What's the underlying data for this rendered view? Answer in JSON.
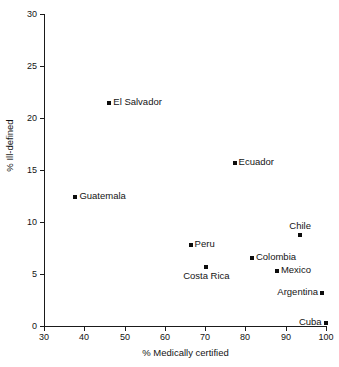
{
  "chart_data": {
    "type": "scatter",
    "title": "",
    "xlabel": "% Medically certified",
    "ylabel": "% Ill-defined",
    "xlim": [
      30,
      100
    ],
    "ylim": [
      0,
      30
    ],
    "xticks": [
      30,
      40,
      50,
      60,
      70,
      80,
      90,
      100
    ],
    "yticks": [
      0,
      5,
      10,
      15,
      20,
      25,
      30
    ],
    "xtick_labels": [
      "30",
      "40",
      "50",
      "60",
      "70",
      "80",
      "90",
      "100"
    ],
    "ytick_labels": [
      "0",
      "5",
      "10",
      "15",
      "20",
      "25",
      "30"
    ],
    "grid": false,
    "legend": "none",
    "marker": "square",
    "marker_color": "#0d0d0d",
    "points": [
      {
        "label": "El Salvador",
        "x": 46.2,
        "y": 21.4,
        "label_pos": "right"
      },
      {
        "label": "Ecuador",
        "x": 77.3,
        "y": 15.7,
        "label_pos": "right"
      },
      {
        "label": "Guatemala",
        "x": 37.8,
        "y": 12.4,
        "label_pos": "right"
      },
      {
        "label": "Chile",
        "x": 93.6,
        "y": 8.8,
        "label_pos": "above"
      },
      {
        "label": "Peru",
        "x": 66.4,
        "y": 7.8,
        "label_pos": "right"
      },
      {
        "label": "Colombia",
        "x": 81.6,
        "y": 6.5,
        "label_pos": "right"
      },
      {
        "label": "Costa Rica",
        "x": 70.3,
        "y": 5.7,
        "label_pos": "below"
      },
      {
        "label": "Mexico",
        "x": 87.8,
        "y": 5.3,
        "label_pos": "right"
      },
      {
        "label": "Argentina",
        "x": 99.0,
        "y": 3.2,
        "label_pos": "left"
      },
      {
        "label": "Cuba",
        "x": 99.9,
        "y": 0.3,
        "label_pos": "left"
      }
    ]
  }
}
